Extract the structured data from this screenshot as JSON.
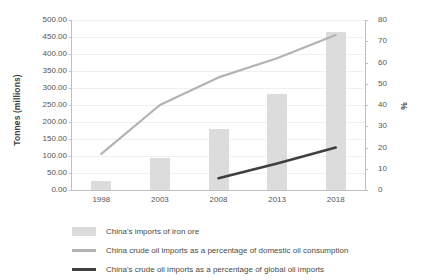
{
  "chart_data": {
    "type": "bar",
    "title": "",
    "subtitle": "",
    "xlabel": "",
    "ylabel": "Tonnes (millions)",
    "y2label": "%",
    "grid": true,
    "legend_position": "bottom-left",
    "categories": [
      "1998",
      "2003",
      "2008",
      "2013",
      "2018"
    ],
    "ylim": [
      0,
      500
    ],
    "y2lim": [
      0,
      80
    ],
    "yticks": [
      "0.00",
      "50.00",
      "100.00",
      "150.00",
      "200.00",
      "250.00",
      "300.00",
      "350.00",
      "400.00",
      "450.00",
      "500.00"
    ],
    "ytick_values": [
      0,
      50,
      100,
      150,
      200,
      250,
      300,
      350,
      400,
      450,
      500
    ],
    "y2ticks": [
      "0",
      "10",
      "20",
      "30",
      "40",
      "50",
      "60",
      "70",
      "80"
    ],
    "y2tick_values": [
      0,
      10,
      20,
      30,
      40,
      50,
      60,
      70,
      80
    ],
    "series": [
      {
        "name": "China's imports of iron ore",
        "type": "bar",
        "axis": "left",
        "color": "#dcdcdc",
        "values": [
          27,
          95,
          180,
          283,
          465
        ]
      },
      {
        "name": "China crude oil imports as a percentage of domestic oil consumption",
        "type": "line",
        "axis": "right",
        "color": "#b3b3b3",
        "values": [
          17,
          40,
          53,
          62,
          73
        ]
      },
      {
        "name": "China's crude oil imports as a percentage of global oil imports",
        "type": "line",
        "axis": "right",
        "color": "#3f3f3f",
        "values": [
          null,
          null,
          5.5,
          12.5,
          20
        ]
      }
    ]
  },
  "legend": {
    "items": [
      {
        "label": "China's imports of iron ore",
        "marker": "box",
        "color": "#dcdcdc"
      },
      {
        "label": "China crude oil imports as a percentage of domestic oil consumption",
        "marker": "line",
        "color": "#b3b3b3"
      },
      {
        "label": "China's crude oil imports as a percentage of global oil imports",
        "marker": "line",
        "color": "#3f3f3f"
      }
    ]
  }
}
